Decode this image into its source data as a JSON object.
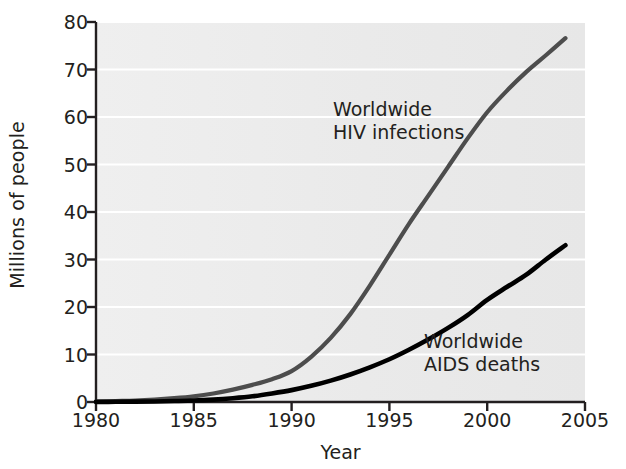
{
  "chart_data": {
    "type": "line",
    "title": "",
    "xlabel": "Year",
    "ylabel": "Millions of people",
    "xlim": [
      1980,
      2005
    ],
    "ylim": [
      0,
      80
    ],
    "xticks": [
      "1980",
      "1985",
      "1990",
      "1995",
      "2000",
      "2005"
    ],
    "yticks": [
      "0",
      "10",
      "20",
      "30",
      "40",
      "50",
      "60",
      "70",
      "80"
    ],
    "grid": "horizontal white gridlines on light gray plot background",
    "legend_position": "inline annotations next to curves",
    "x": [
      1980,
      1981,
      1982,
      1983,
      1984,
      1985,
      1986,
      1987,
      1988,
      1989,
      1990,
      1991,
      1992,
      1993,
      1994,
      1995,
      1996,
      1997,
      1998,
      1999,
      2000,
      2001,
      2002,
      2003,
      2004
    ],
    "series": [
      {
        "name": "Worldwide HIV infections",
        "color": "#4d4d4d",
        "label_line1": "Worldwide",
        "label_line2": "HIV infections",
        "values": [
          0.1,
          0.2,
          0.3,
          0.5,
          0.8,
          1.2,
          1.8,
          2.6,
          3.6,
          4.8,
          6.5,
          9.5,
          13.5,
          18.5,
          24.5,
          31.0,
          37.5,
          43.5,
          49.5,
          55.5,
          61.0,
          65.5,
          69.5,
          73.0,
          76.6
        ]
      },
      {
        "name": "Worldwide AIDS deaths",
        "color": "#000000",
        "label_line1": "Worldwide",
        "label_line2": "AIDS deaths",
        "values": [
          0.02,
          0.04,
          0.07,
          0.12,
          0.2,
          0.3,
          0.5,
          0.8,
          1.2,
          1.8,
          2.5,
          3.4,
          4.5,
          5.8,
          7.3,
          9.0,
          11.0,
          13.2,
          15.6,
          18.3,
          21.5,
          24.2,
          26.8,
          30.0,
          33.0
        ]
      }
    ]
  },
  "axis": {
    "y_title": "Millions of people",
    "x_title": "Year"
  },
  "annotations": {
    "hiv": "Worldwide\nHIV infections",
    "aids": "Worldwide\nAIDS deaths"
  },
  "colors": {
    "plot_background": "#ececec",
    "gridline": "#ffffff",
    "axis": "#231f20",
    "hiv_line": "#4d4d4d",
    "aids_line": "#000000",
    "text": "#231f20"
  }
}
